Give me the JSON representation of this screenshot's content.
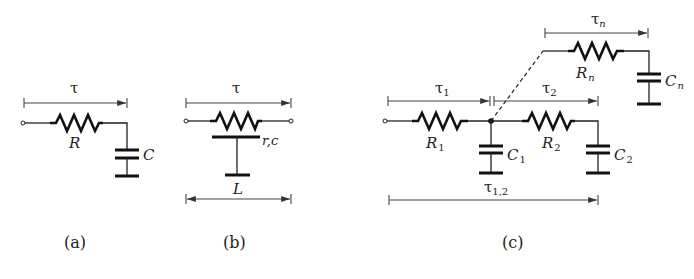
{
  "figure": {
    "panels": [
      {
        "id": "a",
        "caption": "(a)",
        "time_constant": "τ",
        "resistor_label": "R",
        "capacitor_label": "C"
      },
      {
        "id": "b",
        "caption": "(b)",
        "time_constant": "τ",
        "distributed_label": "r,c",
        "length_label": "L"
      },
      {
        "id": "c",
        "caption": "(c)",
        "time_constants": {
          "t1": "τ",
          "t1_sub": "1",
          "t2": "τ",
          "t2_sub": "2",
          "tn": "τ",
          "tn_sub": "n",
          "t12": "τ",
          "t12_sub": "1,2"
        },
        "resistors": [
          {
            "label": "R",
            "sub": "1"
          },
          {
            "label": "R",
            "sub": "2"
          },
          {
            "label": "R",
            "sub": "n"
          }
        ],
        "capacitors": [
          {
            "label": "C",
            "sub": "1"
          },
          {
            "label": "C",
            "sub": "2"
          },
          {
            "label": "C",
            "sub": "n"
          }
        ]
      }
    ]
  }
}
